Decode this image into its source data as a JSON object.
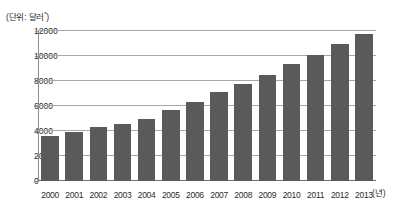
{
  "caption": {
    "unit_label": "(단위: 달러",
    "unit_superscript": "*",
    "unit_label_close": ")"
  },
  "axis": {
    "x_unit_label": "(년)"
  },
  "chart_data": {
    "type": "bar",
    "title": "",
    "subtitle": "",
    "xlabel": "(년)",
    "ylabel": "(단위: 달러*)",
    "categories": [
      "2000",
      "2001",
      "2002",
      "2003",
      "2004",
      "2005",
      "2006",
      "2007",
      "2008",
      "2009",
      "2010",
      "2011",
      "2012",
      "2013"
    ],
    "values": [
      3600,
      3900,
      4300,
      4600,
      5000,
      5650,
      6350,
      7150,
      7800,
      8500,
      9400,
      10100,
      11000,
      11800
    ],
    "series": [
      {
        "name": "1인당 국민소득",
        "values": [
          3600,
          3900,
          4300,
          4600,
          5000,
          5650,
          6350,
          7150,
          7800,
          8500,
          9400,
          10100,
          11000,
          11800
        ]
      }
    ],
    "ylim": [
      0,
      12000
    ],
    "yticks": [
      0,
      2000,
      4000,
      6000,
      8000,
      10000,
      12000
    ],
    "ytick_labels": [
      "0",
      "2000",
      "4000",
      "6000",
      "8000",
      "10000",
      "12000"
    ],
    "grid": true,
    "legend": false,
    "legend_position": "none",
    "bar_color": "#5a5a5a",
    "gridline_color": "#a8a8a8",
    "background_color": "#ffffff"
  }
}
